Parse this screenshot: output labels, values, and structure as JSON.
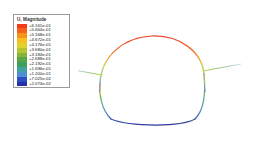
{
  "legend": {
    "title": "U, Magnitude",
    "entries": [
      {
        "value": "+6.161e-01",
        "color": "#f23a18"
      },
      {
        "value": "+5.664e-01",
        "color": "#f4601a"
      },
      {
        "value": "+5.168e-01",
        "color": "#f6931d"
      },
      {
        "value": "+4.672e-01",
        "color": "#f7c01f"
      },
      {
        "value": "+4.176e-01",
        "color": "#dfd22c"
      },
      {
        "value": "+3.680e-01",
        "color": "#b6c431"
      },
      {
        "value": "+3.184e-01",
        "color": "#86b53a"
      },
      {
        "value": "+2.688e-01",
        "color": "#56a744"
      },
      {
        "value": "+2.192e-01",
        "color": "#3f9f5e"
      },
      {
        "value": "+1.696e-01",
        "color": "#45a0a0"
      },
      {
        "value": "+1.200e-01",
        "color": "#4f8fd0"
      },
      {
        "value": "+7.025e-02",
        "color": "#2b4fc0"
      },
      {
        "value": "+2.074e-02",
        "color": "#2732a8"
      }
    ]
  },
  "chart_data": {
    "type": "contour",
    "title": "U, Magnitude",
    "colormap": "rainbow",
    "units": "",
    "vmin": 0.02074,
    "vmax": 0.6161,
    "contour_levels": [
      0.6161,
      0.5664,
      0.5168,
      0.4672,
      0.4176,
      0.368,
      0.3184,
      0.2688,
      0.2192,
      0.1696,
      0.12,
      0.07025,
      0.02074
    ],
    "level_colors": [
      "#f23a18",
      "#f4601a",
      "#f6931d",
      "#f7c01f",
      "#dfd22c",
      "#b6c431",
      "#86b53a",
      "#56a744",
      "#3f9f5e",
      "#45a0a0",
      "#4f8fd0",
      "#2b4fc0",
      "#2732a8"
    ],
    "xlabel": "",
    "ylabel": "",
    "grid": false,
    "legend_position": "upper-left",
    "geometry": {
      "dome_top_y": 36,
      "dome_bottom_y": 122,
      "dome_left_x": 20,
      "dome_right_x": 128,
      "left_branch_count": 3,
      "right_branch_count": 3
    }
  }
}
